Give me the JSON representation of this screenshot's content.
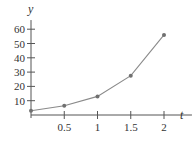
{
  "chart_data": {
    "type": "line",
    "title": "",
    "xlabel": "t",
    "ylabel": "y",
    "x": [
      0,
      0.5,
      1,
      1.5,
      2
    ],
    "series": [
      {
        "name": "y",
        "values": [
          3,
          6.5,
          13,
          27.5,
          56
        ],
        "markers": true
      }
    ],
    "xticks": [
      "0.5",
      "1",
      "1.5",
      "2"
    ],
    "yticks": [
      "10",
      "20",
      "30",
      "40",
      "50",
      "60"
    ],
    "xlim": [
      0,
      2.3
    ],
    "ylim": [
      0,
      65
    ],
    "grid": false,
    "legend": "none",
    "colors": {
      "line": "#8a8a8a",
      "marker": "#707070",
      "axis": "#555555"
    }
  }
}
